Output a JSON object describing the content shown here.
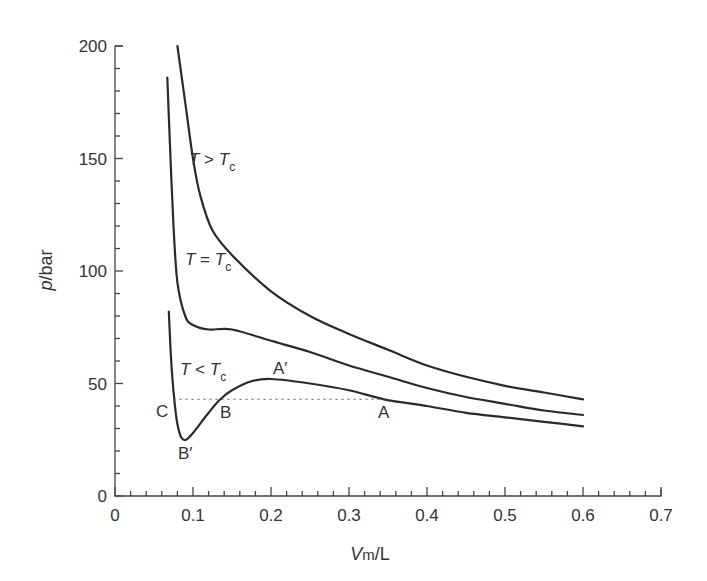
{
  "chart_data": {
    "type": "line",
    "title": "",
    "xlabel": "Vm/L",
    "xlabel_parts": {
      "main": "V",
      "sub": "m",
      "unit": "/L"
    },
    "ylabel": "p/bar",
    "ylabel_parts": {
      "main": "p",
      "unit": "/bar"
    },
    "xlim": [
      0,
      0.7
    ],
    "ylim": [
      0,
      200
    ],
    "xticks": [
      "0",
      "0.1",
      "0.2",
      "0.3",
      "0.4",
      "0.5",
      "0.6",
      "0.7"
    ],
    "yticks": [
      "0",
      "50",
      "100",
      "150",
      "200"
    ],
    "grid": false,
    "legend": "none (inline labels)",
    "series": [
      {
        "name": "T > Tc",
        "x": [
          0.08,
          0.09,
          0.1,
          0.109,
          0.125,
          0.153,
          0.2,
          0.25,
          0.3,
          0.35,
          0.4,
          0.45,
          0.5,
          0.55,
          0.6
        ],
        "y": [
          200,
          175,
          150,
          134,
          118,
          106,
          91,
          80,
          72,
          65,
          58,
          53,
          49,
          46,
          43
        ]
      },
      {
        "name": "T = Tc",
        "x": [
          0.067,
          0.07,
          0.075,
          0.08,
          0.09,
          0.1,
          0.12,
          0.15,
          0.2,
          0.25,
          0.3,
          0.35,
          0.4,
          0.45,
          0.5,
          0.55,
          0.6
        ],
        "y": [
          186,
          160,
          120,
          95,
          80,
          76,
          74,
          74,
          69,
          64,
          58,
          53,
          48,
          44,
          41,
          38,
          36
        ]
      },
      {
        "name": "T < Tc",
        "x": [
          0.069,
          0.072,
          0.076,
          0.08,
          0.085,
          0.091,
          0.1,
          0.12,
          0.135,
          0.15,
          0.175,
          0.2,
          0.25,
          0.3,
          0.345,
          0.4,
          0.45,
          0.5,
          0.55,
          0.6
        ],
        "y": [
          82,
          60,
          43,
          32,
          26,
          25,
          28,
          37,
          43,
          47,
          51,
          52,
          50,
          47,
          43,
          40,
          37,
          35,
          33,
          31
        ]
      }
    ],
    "reference_lines": [
      {
        "type": "horizontal-dotted",
        "y": 43,
        "x_from": 0.075,
        "x_to": 0.345,
        "label": "Maxwell equal-area tie line C–B–A"
      }
    ],
    "annotations": [
      {
        "text": "T > Tc",
        "x": 0.095,
        "y": 150
      },
      {
        "text": "T = Tc",
        "x": 0.09,
        "y": 105
      },
      {
        "text": "T < Tc",
        "x": 0.085,
        "y": 55
      },
      {
        "text": "A′",
        "x": 0.215,
        "y": 57
      },
      {
        "text": "C",
        "x": 0.062,
        "y": 38
      },
      {
        "text": "B",
        "x": 0.145,
        "y": 37
      },
      {
        "text": "B′",
        "x": 0.093,
        "y": 19
      },
      {
        "text": "A",
        "x": 0.345,
        "y": 37
      }
    ]
  },
  "labels": {
    "t_gt": {
      "T": "T",
      "op": " > ",
      "Tc": "T",
      "c": "c"
    },
    "t_eq": {
      "T": "T",
      "op": " = ",
      "Tc": "T",
      "c": "c"
    },
    "t_lt": {
      "T": "T",
      "op": " < ",
      "Tc": "T",
      "c": "c"
    },
    "a_prime": "A′",
    "c": "C",
    "b": "B",
    "b_prime": "B′",
    "a": "A"
  }
}
